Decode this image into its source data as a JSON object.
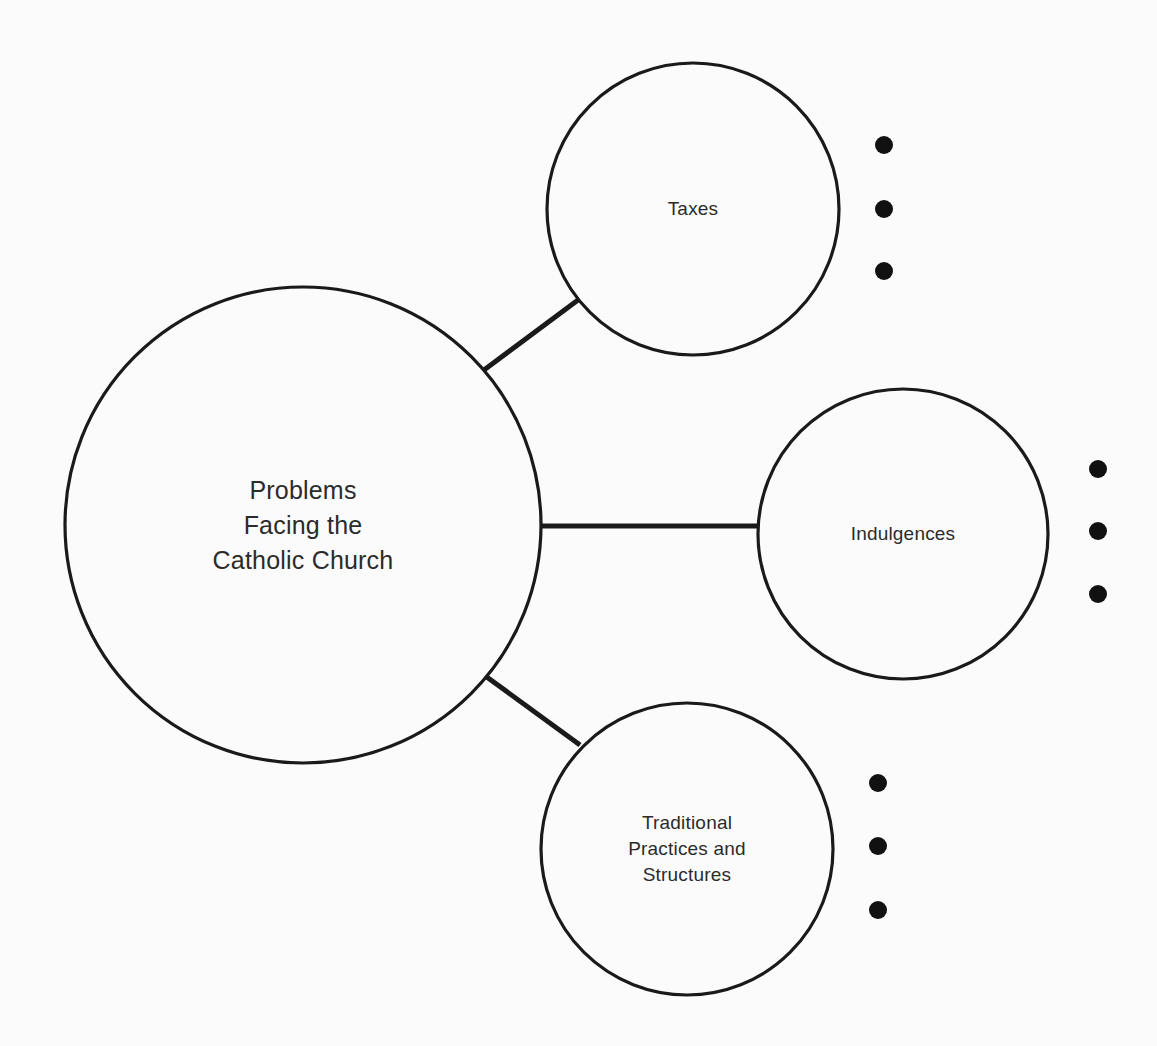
{
  "diagram": {
    "type": "mind-map",
    "title": "Problems Facing the Catholic Church",
    "background_color": "#fbfbfb",
    "stroke_color": "#1a1a1a",
    "text_color": "#2b2b2b",
    "bullet_color": "#111111",
    "central_node": {
      "id": "central",
      "label": "Problems\nFacing the\nCatholic Church",
      "cx": 303,
      "cy": 525,
      "r": 238
    },
    "branches": [
      {
        "id": "taxes",
        "label": "Taxes",
        "cx": 693,
        "cy": 209,
        "r": 146,
        "connector": {
          "x1": 484,
          "y1": 370,
          "x2": 578,
          "y2": 300
        },
        "bullets": {
          "x": 884,
          "ys": [
            145,
            209,
            271
          ],
          "r": 9,
          "count": 3
        }
      },
      {
        "id": "indulgences",
        "label": "Indulgences",
        "cx": 903,
        "cy": 534,
        "r": 145,
        "connector": {
          "x1": 540,
          "y1": 526,
          "x2": 760,
          "y2": 526
        },
        "bullets": {
          "x": 1098,
          "ys": [
            469,
            531,
            594
          ],
          "r": 9,
          "count": 3
        }
      },
      {
        "id": "traditional-practices",
        "label": "Traditional\nPractices and\nStructures",
        "cx": 687,
        "cy": 849,
        "r": 146,
        "connector": {
          "x1": 484,
          "y1": 675,
          "x2": 580,
          "y2": 745
        },
        "bullets": {
          "x": 878,
          "ys": [
            783,
            846,
            910
          ],
          "r": 9,
          "count": 3
        }
      }
    ]
  }
}
